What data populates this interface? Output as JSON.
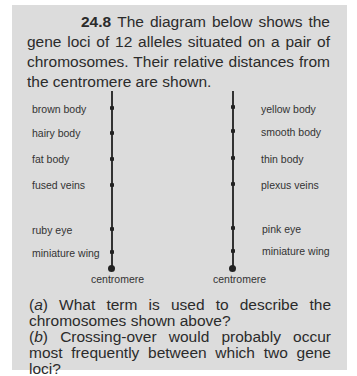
{
  "question": {
    "number": "24.8",
    "intro_text": "The diagram below shows the gene loci of 12 alleles situated on a pair of chromosomes. Their relative distances from the centromere are shown."
  },
  "diagram": {
    "left_chromosome": {
      "loci": [
        {
          "label": "brown body"
        },
        {
          "label": "hairy body"
        },
        {
          "label": "fat body"
        },
        {
          "label": "fused veins"
        },
        {
          "label": "ruby eye"
        },
        {
          "label": "miniature wing"
        }
      ],
      "centromere_label": "centromere"
    },
    "right_chromosome": {
      "loci": [
        {
          "label": "yellow body"
        },
        {
          "label": "smooth body"
        },
        {
          "label": "thin body"
        },
        {
          "label": "plexus veins"
        },
        {
          "label": "pink eye"
        },
        {
          "label": "miniature wing"
        }
      ],
      "centromere_label": "centromere"
    }
  },
  "questions": [
    {
      "label": "(a)",
      "label_letter": "a",
      "text": "What term is used to describe the chromosomes shown above?"
    },
    {
      "label": "(b)",
      "label_letter": "b",
      "text": "Crossing-over would probably occur most frequently between which two gene loci?"
    }
  ]
}
